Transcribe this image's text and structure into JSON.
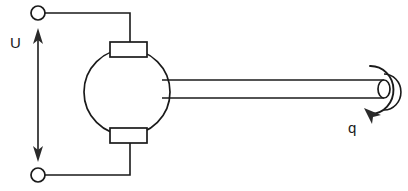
{
  "diagram": {
    "labels": {
      "voltage": "U",
      "flow_rate": "q"
    },
    "colors": {
      "stroke": "#1a1a1a",
      "background": "#ffffff",
      "arrow": "#2a2a2a"
    },
    "components": {
      "terminal_top_name": "terminal-node-top",
      "terminal_bottom_name": "terminal-node-bottom",
      "electrode_top_name": "electrode-top",
      "electrode_bottom_name": "electrode-bottom",
      "chamber_name": "spherical-chamber",
      "capillary_name": "capillary-tube",
      "nozzle_name": "nozzle-outlet"
    },
    "geometry": {
      "width": 408,
      "height": 191,
      "sphere_cx": 127,
      "sphere_cy": 92,
      "sphere_r": 43,
      "tube_x_start": 168,
      "tube_x_end": 382,
      "tube_top_y": 80,
      "tube_bottom_y": 98
    }
  }
}
